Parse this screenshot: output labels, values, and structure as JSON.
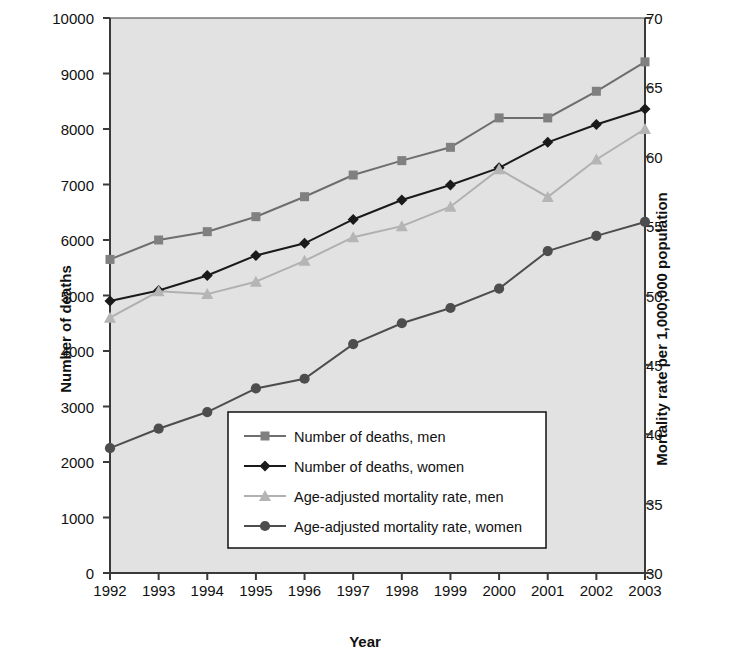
{
  "chart_data": {
    "type": "line",
    "title": "",
    "xlabel": "Year",
    "ylabel": "Number of deaths",
    "ylabel_right": "Mortality rate per 1,000,000 population",
    "categories": [
      "1992",
      "1993",
      "1994",
      "1995",
      "1996",
      "1997",
      "1998",
      "1999",
      "2000",
      "2001",
      "2002",
      "2003"
    ],
    "ylim": [
      0,
      10000
    ],
    "ylim_right": [
      30,
      70
    ],
    "yticks": [
      0,
      1000,
      2000,
      3000,
      4000,
      5000,
      6000,
      7000,
      8000,
      9000,
      10000
    ],
    "yticks_right": [
      30,
      35,
      40,
      45,
      50,
      55,
      60,
      65,
      70
    ],
    "grid": false,
    "legend_position": "inside-bottom-center",
    "series": [
      {
        "name": "Number of deaths, men",
        "axis": "left",
        "marker": "square",
        "color": "#808080",
        "line_color": "#6e6e6e",
        "values": [
          5650,
          6000,
          6150,
          6420,
          6780,
          7170,
          7430,
          7670,
          8200,
          8200,
          8680,
          9210
        ]
      },
      {
        "name": "Number of deaths, women",
        "axis": "left",
        "marker": "diamond",
        "color": "#1a1a1a",
        "line_color": "#1a1a1a",
        "values": [
          4900,
          5090,
          5360,
          5720,
          5940,
          6370,
          6720,
          6990,
          7300,
          7760,
          8080,
          8360
        ]
      },
      {
        "name": "Age-adjusted mortality rate, men",
        "axis": "right",
        "marker": "triangle",
        "color": "#b5b5b5",
        "line_color": "#b0b0b0",
        "values": [
          48.4,
          50.3,
          50.1,
          51.0,
          52.5,
          54.2,
          55.0,
          56.4,
          59.1,
          57.1,
          59.8,
          62.0
        ]
      },
      {
        "name": "Age-adjusted mortality rate, women",
        "axis": "right",
        "marker": "circle",
        "color": "#4d4d4d",
        "line_color": "#4d4d4d",
        "values": [
          39.0,
          40.4,
          41.6,
          43.3,
          44.0,
          46.5,
          48.0,
          49.1,
          50.5,
          53.2,
          54.3,
          55.3
        ]
      }
    ]
  },
  "plot": {
    "background": "#e2e2e2",
    "border_color": "#3a3a3a"
  }
}
